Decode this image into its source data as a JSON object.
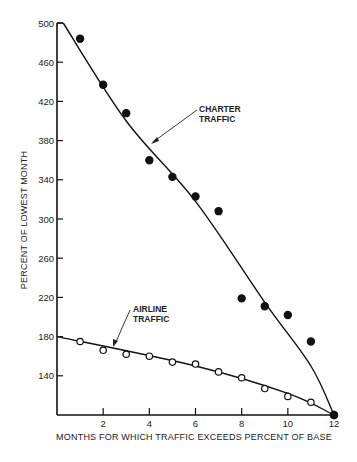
{
  "chart_data": {
    "type": "scatter",
    "title": "",
    "xlabel": "MONTHS FOR WHICH TRAFFIC EXCEEDS PERCENT OF BASE",
    "ylabel": "PERCENT OF LOWEST MONTH",
    "xlim": [
      0,
      12
    ],
    "ylim": [
      100,
      500
    ],
    "x_ticks": [
      2,
      4,
      6,
      8,
      10,
      12
    ],
    "y_ticks": [
      140,
      180,
      220,
      260,
      300,
      340,
      380,
      420,
      460,
      500
    ],
    "grid": false,
    "legend": "none (inline annotations)",
    "series": [
      {
        "name": "CHARTER TRAFFIC",
        "marker": "filled-circle",
        "points": [
          {
            "x": 1,
            "y": 484
          },
          {
            "x": 2,
            "y": 437
          },
          {
            "x": 3,
            "y": 408
          },
          {
            "x": 4,
            "y": 360
          },
          {
            "x": 5,
            "y": 343
          },
          {
            "x": 6,
            "y": 323
          },
          {
            "x": 7,
            "y": 308
          },
          {
            "x": 8,
            "y": 219
          },
          {
            "x": 9,
            "y": 211
          },
          {
            "x": 10,
            "y": 202
          },
          {
            "x": 11,
            "y": 175
          },
          {
            "x": 12,
            "y": 100
          }
        ],
        "fit_line": [
          {
            "x": 0,
            "y": 500
          },
          {
            "x": 3,
            "y": 400
          },
          {
            "x": 6,
            "y": 318
          },
          {
            "x": 9,
            "y": 215
          },
          {
            "x": 11,
            "y": 150
          },
          {
            "x": 12,
            "y": 100
          }
        ]
      },
      {
        "name": "AIRLINE TRAFFIC",
        "marker": "open-circle",
        "points": [
          {
            "x": 1,
            "y": 175
          },
          {
            "x": 2,
            "y": 166
          },
          {
            "x": 3,
            "y": 162
          },
          {
            "x": 4,
            "y": 160
          },
          {
            "x": 5,
            "y": 154
          },
          {
            "x": 6,
            "y": 152
          },
          {
            "x": 7,
            "y": 144
          },
          {
            "x": 8,
            "y": 138
          },
          {
            "x": 9,
            "y": 127
          },
          {
            "x": 10,
            "y": 119
          },
          {
            "x": 11,
            "y": 113
          },
          {
            "x": 12,
            "y": 100
          }
        ],
        "fit_line": [
          {
            "x": 0,
            "y": 180
          },
          {
            "x": 6,
            "y": 150
          },
          {
            "x": 10,
            "y": 122
          },
          {
            "x": 12,
            "y": 100
          }
        ]
      }
    ],
    "annotations": [
      {
        "text": [
          "CHARTER",
          "TRAFFIC"
        ],
        "points_to": "charter fit line near x=5.8"
      },
      {
        "text": [
          "AIRLINE",
          "TRAFFIC"
        ],
        "points_to": "airline fit line near x=2.5"
      }
    ]
  },
  "labels": {
    "y_axis_title": "PERCENT OF LOWEST MONTH",
    "x_axis_title": "MONTHS FOR WHICH TRAFFIC EXCEEDS PERCENT OF BASE",
    "charter_line1": "CHARTER",
    "charter_line2": "TRAFFIC",
    "airline_line1": "AIRLINE",
    "airline_line2": "TRAFFIC"
  }
}
